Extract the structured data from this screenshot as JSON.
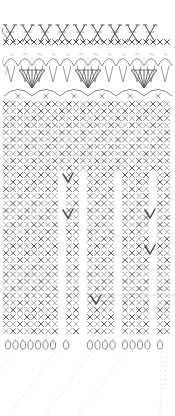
{
  "document": {
    "title": "Crochet Stitch Diagram",
    "kind": "crochet-pattern-chart",
    "width": 175,
    "height": 416,
    "background": "#ffffff"
  },
  "palette": {
    "stitch_dark": "#4a4a4a",
    "stitch_mid": "#7d7d7d",
    "stitch_light": "#a8a8a8",
    "guide_faint": "#cfcfcf",
    "guide_very_faint": "#e2e2e2"
  },
  "bands": [
    {
      "id": "band-crossed-stitches",
      "name": "crossed-double-crochet-band",
      "y_top": 24,
      "y_bottom": 46,
      "symbol": "crossed-stitch-X",
      "motif_count": 9,
      "motif_pitch": 17.5,
      "motif_x_start": 10,
      "base_row": {
        "name": "single-crochet-base-row",
        "symbol": "x",
        "count": 24,
        "y": 42,
        "pitch": 7.0,
        "x_start": 6
      }
    },
    {
      "id": "band-shell-fans",
      "name": "shell-fan-band",
      "y_top": 52,
      "y_bottom": 100,
      "fan_count": 3,
      "fan_pitch": 56,
      "fan_x_start": 32,
      "fan_spokes": 7,
      "picot_arch_count": 12,
      "picot_pitch": 14,
      "lower_arch_count": 6,
      "lower_arch_pitch": 28
    },
    {
      "id": "band-sc-grid",
      "name": "single-crochet-grid",
      "y_top": 101,
      "y_bottom": 336,
      "symbol": "x",
      "columns": 24,
      "rows": 33,
      "col_pitch": 7.0,
      "row_pitch": 7.1,
      "x_start": 6,
      "notes": "solid at top, splits into vertical strips toward the bottom"
    },
    {
      "id": "band-chain-fringe",
      "name": "chain-loop-fringe",
      "y_top": 338,
      "y_bottom": 352,
      "symbol": "chain-oval",
      "groups": [
        {
          "count": 7,
          "x_start": 8
        },
        {
          "count": 1,
          "x_start": 66
        },
        {
          "count": 4,
          "x_start": 90
        },
        {
          "count": 4,
          "x_start": 125
        },
        {
          "count": 1,
          "x_start": 160
        }
      ],
      "oval_pitch": 7.5
    },
    {
      "id": "band-guide-lines",
      "name": "diagonal-guide-lines",
      "y_top": 352,
      "y_bottom": 416,
      "line_count": 5,
      "style": "faint-dotted-diagonal"
    }
  ],
  "marks": [
    {
      "id": "v-mark-1",
      "name": "decrease-v-mark",
      "x": 68,
      "y": 178,
      "symbol": "v"
    },
    {
      "id": "v-mark-2",
      "name": "decrease-v-mark",
      "x": 68,
      "y": 214,
      "symbol": "v"
    },
    {
      "id": "v-mark-3",
      "name": "decrease-v-mark",
      "x": 150,
      "y": 214,
      "symbol": "v"
    },
    {
      "id": "v-mark-4",
      "name": "decrease-v-mark",
      "x": 96,
      "y": 300,
      "symbol": "v"
    },
    {
      "id": "v-mark-5",
      "name": "decrease-v-mark",
      "x": 150,
      "y": 250,
      "symbol": "v"
    }
  ],
  "strips": {
    "name": "grid-vertical-strips",
    "description": "lower grid divided by blank vertical channels",
    "channels_x": [
      64,
      86,
      120,
      152
    ],
    "channel_width": 7,
    "channel_y_start": 168
  }
}
